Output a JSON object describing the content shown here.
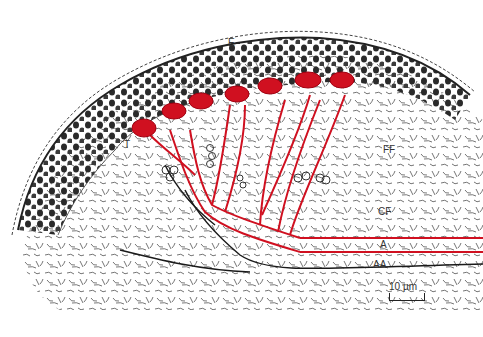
{
  "figure": {
    "type": "histology-illustration",
    "labels": {
      "E": "E",
      "T": "T",
      "FF": "FF",
      "CF": "CF",
      "A": "A",
      "AA": "AA"
    },
    "scale_bar": {
      "label": "10 µm"
    },
    "colors": {
      "vessel": "#d01020",
      "ink": "#222222",
      "background": "#ffffff"
    }
  }
}
